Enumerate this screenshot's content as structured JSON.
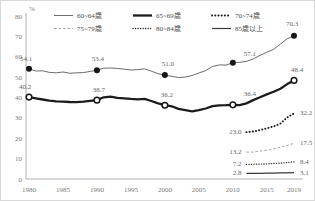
{
  "frame": {
    "background": "#ffffff",
    "border_color": "#d9d9d9"
  },
  "axes": {
    "unit_label": "%",
    "y_ticks": [
      "0",
      "10",
      "20",
      "30",
      "40",
      "50",
      "60",
      "70",
      "80"
    ],
    "x_ticks": [
      "1980",
      "1985",
      "1990",
      "1995",
      "2000",
      "2005",
      "2010",
      "2015",
      "2019"
    ],
    "axis_color": "#b0b0b0",
    "tick_text_color": "#7a7a7a"
  },
  "legend": {
    "rows": [
      [
        {
          "label": "60~64歳",
          "style": "thin-solid"
        },
        {
          "label": "65~69歳",
          "style": "thick-solid"
        },
        {
          "label": "70~74歳",
          "style": "bold-dotted"
        }
      ],
      [
        {
          "label": "75~79歳",
          "style": "thin-dashed"
        },
        {
          "label": "80~84歳",
          "style": "fine-dotted"
        },
        {
          "label": "85歳以上",
          "style": "medium-solid"
        }
      ]
    ]
  },
  "chart_data": {
    "type": "line",
    "unit": "%",
    "title": "",
    "ylim": [
      0,
      80
    ],
    "y_tick_step": 10,
    "x_tick_years": [
      1980,
      1985,
      1990,
      1995,
      2000,
      2005,
      2010,
      2015,
      2019
    ],
    "grid": false,
    "legend_position": "top",
    "series": [
      {
        "name": "60~64歳",
        "style": "thin-solid",
        "marker": "filled-circle",
        "start_year": 1980,
        "values": [
          54.1,
          53.0,
          53.1,
          52.3,
          52.1,
          52.5,
          51.9,
          52.1,
          52.2,
          52.8,
          53.4,
          54.4,
          54.5,
          54.3,
          53.9,
          53.5,
          53.7,
          54.1,
          52.9,
          51.7,
          51.0,
          50.4,
          49.8,
          50.0,
          50.8,
          52.0,
          53.2,
          55.2,
          56.0,
          55.9,
          57.1,
          57.3,
          57.7,
          58.9,
          60.7,
          62.2,
          63.6,
          66.2,
          68.8,
          70.3
        ],
        "marker_years": [
          1980,
          1990,
          2000,
          2010,
          2019
        ],
        "point_labels": [
          {
            "year": 1980,
            "text": "54.1",
            "dx": -3,
            "dy": -8
          },
          {
            "year": 1990,
            "text": "53.4",
            "dx": 1,
            "dy": -9
          },
          {
            "year": 2000,
            "text": "51.0",
            "dx": 3,
            "dy": -9
          },
          {
            "year": 2010,
            "text": "57.1",
            "dx": 17,
            "dy": -7
          },
          {
            "year": 2019,
            "text": "70.3",
            "dx": -2,
            "dy": -10
          }
        ]
      },
      {
        "name": "65~69歳",
        "style": "thick-solid",
        "marker": "open-circle",
        "start_year": 1980,
        "values": [
          40.2,
          39.6,
          39.0,
          38.5,
          38.1,
          38.0,
          37.8,
          37.7,
          38.0,
          38.4,
          38.7,
          40.1,
          40.4,
          39.8,
          39.6,
          39.3,
          39.1,
          39.3,
          38.3,
          37.1,
          36.2,
          35.7,
          34.4,
          33.8,
          33.2,
          33.8,
          34.6,
          35.8,
          36.1,
          36.2,
          36.4,
          36.2,
          37.1,
          38.7,
          40.1,
          41.5,
          42.8,
          44.3,
          46.6,
          48.4
        ],
        "marker_years": [
          1980,
          1990,
          2000,
          2010,
          2019
        ],
        "point_labels": [
          {
            "year": 1980,
            "text": "40.2",
            "dx": -4,
            "dy": -8
          },
          {
            "year": 1990,
            "text": "38.7",
            "dx": 2,
            "dy": -8
          },
          {
            "year": 2000,
            "text": "36.2",
            "dx": 2,
            "dy": -8
          },
          {
            "year": 2010,
            "text": "36.4",
            "dx": 17,
            "dy": -9
          },
          {
            "year": 2019,
            "text": "48.4",
            "dx": 3,
            "dy": -8
          }
        ]
      },
      {
        "name": "70~74歳",
        "style": "bold-dotted",
        "start_year": 2012,
        "values": [
          23.0,
          23.3,
          24.0,
          24.9,
          25.8,
          27.2,
          30.2,
          32.2
        ],
        "edge_labels": {
          "start": "23.0",
          "end": "32.2"
        }
      },
      {
        "name": "75~79歳",
        "style": "thin-dashed",
        "start_year": 2012,
        "values": [
          13.2,
          13.2,
          13.7,
          14.2,
          14.8,
          15.6,
          16.5,
          17.5
        ],
        "edge_labels": {
          "start": "13.2",
          "end": "17.5"
        }
      },
      {
        "name": "80~84歳",
        "style": "fine-dotted",
        "start_year": 2012,
        "values": [
          7.2,
          7.2,
          7.3,
          7.4,
          7.6,
          7.8,
          8.1,
          8.4
        ],
        "edge_labels": {
          "start": "7.2",
          "end": "8.4"
        }
      },
      {
        "name": "85歳以上",
        "style": "medium-solid",
        "start_year": 2012,
        "values": [
          2.8,
          2.8,
          2.8,
          2.9,
          2.9,
          3.0,
          3.0,
          3.1
        ],
        "edge_labels": {
          "start": "2.8",
          "end": "3.1"
        }
      }
    ]
  }
}
